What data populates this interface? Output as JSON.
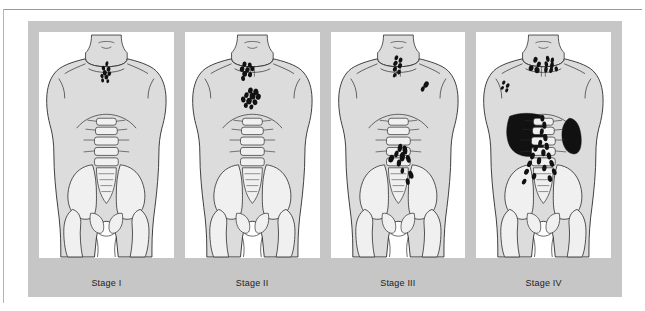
{
  "figure": {
    "type": "medical-staging-diagram",
    "panel_count": 4,
    "colors": {
      "frame_gray": "#c6c6c6",
      "panel_white": "#ffffff",
      "body_fill": "#dcdcdc",
      "bone_fill": "#f0f0f0",
      "pelvis_shadow": "#b9b9b9",
      "node_black": "#111111",
      "outline": "#2b2b2b",
      "label_text": "#1c1c1c",
      "rule_gray": "#9a9a9a"
    },
    "panels": [
      {
        "id": "stage-1",
        "label": "Stage I",
        "involvement": "Single lymph node region — right lower cervical / supraclavicular",
        "regions": [
          "right cervical"
        ],
        "organs_involved": [],
        "node_count": 9,
        "nodes": [
          {
            "cx": 68.5,
            "cy": 31.0,
            "rx": 1.5,
            "ry": 2.6,
            "rot": 12
          },
          {
            "cx": 65.0,
            "cy": 35.5,
            "rx": 1.7,
            "ry": 2.4,
            "rot": -10
          },
          {
            "cx": 70.2,
            "cy": 36.4,
            "rx": 1.9,
            "ry": 2.5,
            "rot": 18
          },
          {
            "cx": 66.4,
            "cy": 40.0,
            "rx": 2.1,
            "ry": 2.6,
            "rot": 0
          },
          {
            "cx": 71.0,
            "cy": 41.0,
            "rx": 1.8,
            "ry": 2.3,
            "rot": 22
          },
          {
            "cx": 63.6,
            "cy": 43.4,
            "rx": 1.6,
            "ry": 2.2,
            "rot": -18
          },
          {
            "cx": 68.0,
            "cy": 44.6,
            "rx": 1.9,
            "ry": 2.4,
            "rot": 8
          },
          {
            "cx": 64.2,
            "cy": 47.8,
            "rx": 1.5,
            "ry": 2.1,
            "rot": -6
          },
          {
            "cx": 69.4,
            "cy": 48.6,
            "rx": 1.4,
            "ry": 2.0,
            "rot": 14
          }
        ]
      },
      {
        "id": "stage-2",
        "label": "Stage II",
        "involvement": "Two or more node regions on the same side of the diaphragm — cervical and mediastinal",
        "regions": [
          "left cervical",
          "mediastinal"
        ],
        "organs_involved": [],
        "node_count": 18,
        "nodes": [
          {
            "cx": 60.0,
            "cy": 31.5,
            "rx": 2.1,
            "ry": 2.8,
            "rot": 10
          },
          {
            "cx": 65.4,
            "cy": 32.4,
            "rx": 2.0,
            "ry": 2.6,
            "rot": -12
          },
          {
            "cx": 57.6,
            "cy": 36.4,
            "rx": 2.3,
            "ry": 2.9,
            "rot": 6
          },
          {
            "cx": 63.0,
            "cy": 37.2,
            "rx": 2.2,
            "ry": 2.8,
            "rot": 18
          },
          {
            "cx": 68.0,
            "cy": 36.0,
            "rx": 1.9,
            "ry": 2.5,
            "rot": -8
          },
          {
            "cx": 60.2,
            "cy": 41.2,
            "rx": 2.4,
            "ry": 3.0,
            "rot": 0
          },
          {
            "cx": 65.6,
            "cy": 42.0,
            "rx": 2.1,
            "ry": 2.7,
            "rot": 14
          },
          {
            "cx": 58.6,
            "cy": 45.8,
            "rx": 2.0,
            "ry": 2.6,
            "rot": -14
          },
          {
            "cx": 66.0,
            "cy": 58.0,
            "rx": 2.4,
            "ry": 3.1,
            "rot": 8
          },
          {
            "cx": 71.6,
            "cy": 59.4,
            "rx": 2.6,
            "ry": 3.3,
            "rot": -10
          },
          {
            "cx": 62.0,
            "cy": 62.6,
            "rx": 2.2,
            "ry": 2.9,
            "rot": 16
          },
          {
            "cx": 68.2,
            "cy": 63.6,
            "rx": 3.0,
            "ry": 3.6,
            "rot": 0
          },
          {
            "cx": 74.0,
            "cy": 64.2,
            "rx": 2.5,
            "ry": 3.1,
            "rot": 12
          },
          {
            "cx": 58.8,
            "cy": 67.0,
            "rx": 2.3,
            "ry": 3.0,
            "rot": -6
          },
          {
            "cx": 64.6,
            "cy": 68.6,
            "rx": 2.8,
            "ry": 3.4,
            "rot": 10
          },
          {
            "cx": 70.6,
            "cy": 69.8,
            "rx": 2.4,
            "ry": 3.0,
            "rot": -14
          },
          {
            "cx": 61.4,
            "cy": 73.0,
            "rx": 2.1,
            "ry": 2.7,
            "rot": 4
          },
          {
            "cx": 67.0,
            "cy": 74.6,
            "rx": 2.0,
            "ry": 2.6,
            "rot": 18
          }
        ]
      },
      {
        "id": "stage-3",
        "label": "Stage III",
        "involvement": "Node regions on both sides of the diaphragm — cervical, axillary, para-aortic and pelvic",
        "regions": [
          "left cervical",
          "left axillary",
          "para-aortic",
          "iliac",
          "inguinal"
        ],
        "organs_involved": [],
        "node_count": 19,
        "nodes": [
          {
            "cx": 66.0,
            "cy": 25.0,
            "rx": 1.8,
            "ry": 2.6,
            "rot": 24
          },
          {
            "cx": 70.2,
            "cy": 27.4,
            "rx": 1.9,
            "ry": 2.7,
            "rot": 18
          },
          {
            "cx": 65.0,
            "cy": 30.6,
            "rx": 2.0,
            "ry": 2.8,
            "rot": 28
          },
          {
            "cx": 69.6,
            "cy": 33.0,
            "rx": 2.0,
            "ry": 2.8,
            "rot": 20
          },
          {
            "cx": 64.4,
            "cy": 36.4,
            "rx": 1.9,
            "ry": 2.7,
            "rot": 26
          },
          {
            "cx": 68.6,
            "cy": 39.4,
            "rx": 1.8,
            "ry": 2.5,
            "rot": 16
          },
          {
            "cx": 64.2,
            "cy": 42.6,
            "rx": 1.6,
            "ry": 2.3,
            "rot": 30
          },
          {
            "cx": 96.0,
            "cy": 52.0,
            "rx": 2.4,
            "ry": 3.4,
            "rot": 28
          },
          {
            "cx": 92.6,
            "cy": 56.4,
            "rx": 1.9,
            "ry": 2.8,
            "rot": 24
          },
          {
            "cx": 69.6,
            "cy": 116.0,
            "rx": 2.2,
            "ry": 4.2,
            "rot": 10
          },
          {
            "cx": 74.6,
            "cy": 118.0,
            "rx": 2.4,
            "ry": 4.6,
            "rot": -6
          },
          {
            "cx": 66.0,
            "cy": 122.0,
            "rx": 2.0,
            "ry": 3.6,
            "rot": 16
          },
          {
            "cx": 72.0,
            "cy": 124.8,
            "rx": 2.6,
            "ry": 4.8,
            "rot": 4
          },
          {
            "cx": 60.8,
            "cy": 126.8,
            "rx": 2.6,
            "ry": 4.0,
            "rot": 22
          },
          {
            "cx": 78.0,
            "cy": 127.0,
            "rx": 2.2,
            "ry": 4.0,
            "rot": -12
          },
          {
            "cx": 68.6,
            "cy": 131.2,
            "rx": 2.2,
            "ry": 3.6,
            "rot": 8
          },
          {
            "cx": 80.6,
            "cy": 143.0,
            "rx": 2.4,
            "ry": 4.2,
            "rot": -18
          },
          {
            "cx": 77.4,
            "cy": 150.0,
            "rx": 2.0,
            "ry": 3.4,
            "rot": -10
          },
          {
            "cx": 72.0,
            "cy": 139.0,
            "rx": 1.8,
            "ry": 3.0,
            "rot": 6
          }
        ]
      },
      {
        "id": "stage-4",
        "label": "Stage IV",
        "involvement": "Disseminated extranodal disease — liver and spleen plus widespread nodes",
        "regions": [
          "bilateral cervical",
          "right axillary",
          "para-aortic",
          "iliac",
          "inguinal"
        ],
        "organs_involved": [
          "liver",
          "spleen"
        ],
        "node_count": 34,
        "nodes": [
          {
            "cx": 60.0,
            "cy": 27.0,
            "rx": 2.1,
            "ry": 3.0,
            "rot": 16
          },
          {
            "cx": 72.4,
            "cy": 26.0,
            "rx": 1.8,
            "ry": 3.2,
            "rot": -8
          },
          {
            "cx": 77.0,
            "cy": 27.6,
            "rx": 1.7,
            "ry": 3.0,
            "rot": 6
          },
          {
            "cx": 63.4,
            "cy": 31.6,
            "rx": 2.0,
            "ry": 2.8,
            "rot": 20
          },
          {
            "cx": 71.0,
            "cy": 31.4,
            "rx": 1.8,
            "ry": 3.0,
            "rot": -10
          },
          {
            "cx": 76.6,
            "cy": 32.6,
            "rx": 1.9,
            "ry": 3.2,
            "rot": 10
          },
          {
            "cx": 55.6,
            "cy": 35.4,
            "rx": 2.4,
            "ry": 3.0,
            "rot": 14
          },
          {
            "cx": 61.6,
            "cy": 37.4,
            "rx": 2.6,
            "ry": 3.2,
            "rot": -6
          },
          {
            "cx": 70.6,
            "cy": 36.8,
            "rx": 1.8,
            "ry": 3.0,
            "rot": 4
          },
          {
            "cx": 75.8,
            "cy": 37.6,
            "rx": 1.9,
            "ry": 2.8,
            "rot": 18
          },
          {
            "cx": 81.0,
            "cy": 36.2,
            "rx": 1.7,
            "ry": 2.6,
            "rot": -12
          },
          {
            "cx": 28.0,
            "cy": 50.0,
            "rx": 1.5,
            "ry": 2.2,
            "rot": 30
          },
          {
            "cx": 32.0,
            "cy": 53.0,
            "rx": 1.6,
            "ry": 2.4,
            "rot": 26
          },
          {
            "cx": 26.6,
            "cy": 55.4,
            "rx": 1.4,
            "ry": 2.0,
            "rot": 34
          },
          {
            "cx": 31.0,
            "cy": 57.8,
            "rx": 1.5,
            "ry": 2.2,
            "rot": 22
          },
          {
            "cx": 67.0,
            "cy": 86.0,
            "rx": 2.0,
            "ry": 3.4,
            "rot": 4
          },
          {
            "cx": 69.0,
            "cy": 93.0,
            "rx": 2.1,
            "ry": 3.6,
            "rot": -6
          },
          {
            "cx": 66.4,
            "cy": 99.6,
            "rx": 2.0,
            "ry": 3.4,
            "rot": 8
          },
          {
            "cx": 70.0,
            "cy": 105.6,
            "rx": 2.2,
            "ry": 3.6,
            "rot": -4
          },
          {
            "cx": 64.8,
            "cy": 111.0,
            "rx": 2.0,
            "ry": 3.2,
            "rot": 10
          },
          {
            "cx": 71.4,
            "cy": 114.4,
            "rx": 2.2,
            "ry": 3.6,
            "rot": -8
          },
          {
            "cx": 60.2,
            "cy": 116.4,
            "rx": 2.2,
            "ry": 3.4,
            "rot": 16
          },
          {
            "cx": 68.0,
            "cy": 120.8,
            "rx": 2.2,
            "ry": 3.6,
            "rot": 0
          },
          {
            "cx": 57.0,
            "cy": 124.0,
            "rx": 2.2,
            "ry": 3.4,
            "rot": 20
          },
          {
            "cx": 73.6,
            "cy": 124.0,
            "rx": 2.2,
            "ry": 3.6,
            "rot": -12
          },
          {
            "cx": 63.6,
            "cy": 129.0,
            "rx": 2.2,
            "ry": 3.6,
            "rot": 6
          },
          {
            "cx": 54.0,
            "cy": 132.0,
            "rx": 2.2,
            "ry": 3.4,
            "rot": 24
          },
          {
            "cx": 76.4,
            "cy": 131.6,
            "rx": 2.2,
            "ry": 3.6,
            "rot": -16
          },
          {
            "cx": 69.0,
            "cy": 136.2,
            "rx": 2.2,
            "ry": 3.4,
            "rot": 8
          },
          {
            "cx": 51.0,
            "cy": 140.0,
            "rx": 2.2,
            "ry": 3.2,
            "rot": 26
          },
          {
            "cx": 79.0,
            "cy": 140.0,
            "rx": 2.2,
            "ry": 3.4,
            "rot": -20
          },
          {
            "cx": 58.6,
            "cy": 144.6,
            "rx": 2.2,
            "ry": 3.4,
            "rot": 12
          },
          {
            "cx": 74.6,
            "cy": 147.0,
            "rx": 2.2,
            "ry": 3.4,
            "rot": -10
          },
          {
            "cx": 48.6,
            "cy": 150.0,
            "rx": 2.0,
            "ry": 3.0,
            "rot": 28
          }
        ]
      }
    ]
  }
}
